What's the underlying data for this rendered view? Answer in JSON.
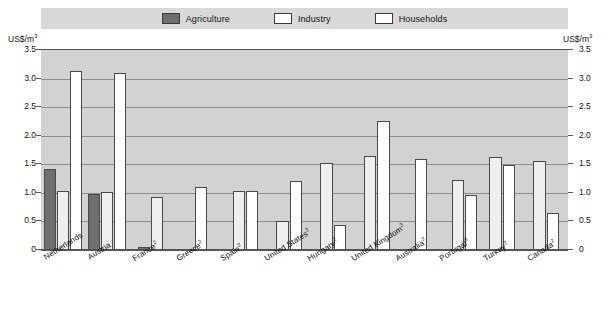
{
  "legend": {
    "items": [
      {
        "label": "Agriculture",
        "swatch": "agriculture",
        "color": "#6e6e6e"
      },
      {
        "label": "Industry",
        "swatch": "industry",
        "color": "#ffffff"
      },
      {
        "label": "Households",
        "swatch": "households",
        "color": "#ffffff"
      }
    ]
  },
  "axes": {
    "unit_left": "US$/m",
    "unit_left_sup": "3",
    "unit_right": "US$/m",
    "unit_right_sup": "3",
    "yticks": [
      "3.5",
      "3.0",
      "2.5",
      "2.0",
      "1.5",
      "1.0",
      "0.5",
      "0"
    ]
  },
  "chart_data": {
    "type": "bar",
    "title": "",
    "xlabel": "",
    "ylabel": "US$/m3",
    "ylim": [
      0,
      3.5
    ],
    "ytick_values": [
      0,
      0.5,
      1.0,
      1.5,
      2.0,
      2.5,
      3.0,
      3.5
    ],
    "grid": true,
    "legend_position": "top",
    "categories": [
      "Netherlands",
      "Austria",
      "France",
      "Greece",
      "Spain",
      "United States",
      "Hungary",
      "United Kingdom",
      "Australia",
      "Portugal",
      "Turkey",
      "Canada"
    ],
    "category_footnotes": [
      "",
      "",
      "2",
      "2",
      "2",
      "2",
      "2",
      "3",
      "2",
      "3",
      "2",
      "2"
    ],
    "series": [
      {
        "name": "Agriculture",
        "color": "#6e6e6e",
        "values": [
          1.42,
          0.98,
          0.05,
          0.02,
          0.02,
          0.02,
          0.02,
          0.02,
          0.02,
          0.02,
          null,
          null
        ]
      },
      {
        "name": "Industry",
        "color": "#efefef",
        "values": [
          1.04,
          1.02,
          0.92,
          null,
          1.03,
          0.51,
          1.53,
          1.65,
          null,
          1.22,
          1.63,
          1.56
        ]
      },
      {
        "name": "Households",
        "color": "#ffffff",
        "values": [
          3.13,
          3.1,
          null,
          1.1,
          1.03,
          1.21,
          0.43,
          2.26,
          1.6,
          0.97,
          1.48,
          0.65
        ]
      }
    ]
  }
}
